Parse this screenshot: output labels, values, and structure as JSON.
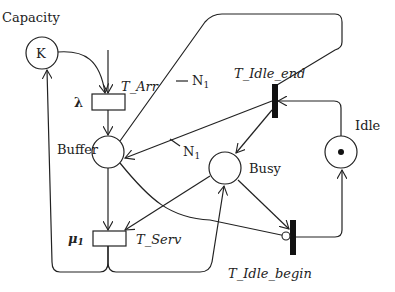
{
  "diagram": {
    "type": "petri-net",
    "places": [
      {
        "id": "capacity",
        "label": "Capacity",
        "token_label": "K"
      },
      {
        "id": "buffer",
        "label": "Buffer"
      },
      {
        "id": "busy",
        "label": "Busy"
      },
      {
        "id": "idle",
        "label": "Idle",
        "tokens": 1
      }
    ],
    "transitions": [
      {
        "id": "t_arr",
        "label": "T_Arr",
        "rate": "λ",
        "kind": "timed"
      },
      {
        "id": "t_serv",
        "label": "T_Serv",
        "rate": "μ",
        "rate_sub": "1",
        "kind": "timed"
      },
      {
        "id": "t_idle_end",
        "label": "T_Idle_end",
        "kind": "immediate"
      },
      {
        "id": "t_idle_begin",
        "label": "T_Idle_begin",
        "kind": "immediate"
      }
    ],
    "arc_weights": [
      {
        "label": "N",
        "sub": "1"
      },
      {
        "label": "N",
        "sub": "1"
      }
    ]
  }
}
